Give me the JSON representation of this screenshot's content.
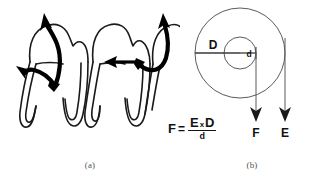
{
  "figure": {
    "background_color": "#ffffff",
    "ink_color": "#111111",
    "line_color": "#4a4a4a"
  },
  "panel_a": {
    "caption": "(a)",
    "description": "Three molar teeth in cross-section with curved force arrows",
    "teeth_count": 3,
    "arrows": [
      {
        "name": "left-extrusion-arrow",
        "direction": "up",
        "style": "thick-curved"
      },
      {
        "name": "left-apical-arrow",
        "direction": "left-down",
        "style": "thick-curved"
      },
      {
        "name": "center-horizontal-arrow",
        "direction": "left",
        "style": "solid-straight"
      },
      {
        "name": "right-extrusion-arrow",
        "direction": "up",
        "style": "thick-curved"
      }
    ]
  },
  "panel_b": {
    "caption": "(b)",
    "description": "Concentric circles lever diagram",
    "labels": {
      "large_radius": "D",
      "small_radius": "d",
      "force_arrow": "F",
      "effort_arrow": "E"
    },
    "formula": {
      "left": "F",
      "equals": "=",
      "numerator_first": "E",
      "numerator_times": "x",
      "numerator_second": "D",
      "denominator": "d"
    }
  }
}
